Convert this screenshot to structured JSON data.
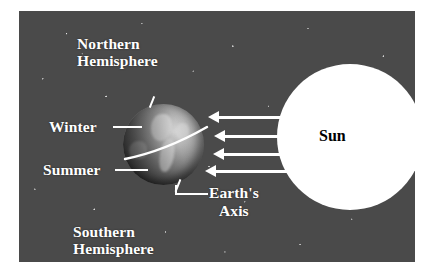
{
  "diagram": {
    "background_color": "#4a4a4a",
    "labels": {
      "northern_hemisphere": "Northern\nHemisphere",
      "southern_hemisphere": "Southern\nHemisphere",
      "winter": "Winter",
      "summer": "Summer",
      "earths_axis": "Earth's\nAxis",
      "sun": "Sun"
    },
    "objects": {
      "sun": {
        "name": "Sun",
        "shape": "circle",
        "fill_color": "#ffffff",
        "label_color": "#000000"
      },
      "earth": {
        "name": "Earth",
        "shape": "sphere",
        "equator_line_color": "#ffffff",
        "axis_color": "#ffffff",
        "axis_tilt_note": "tilted axis, North Pole leaning away from Sun"
      }
    },
    "sun_rays": {
      "count": 4,
      "color": "#ffffff",
      "direction": "right-to-left, from Sun toward Earth"
    },
    "leader_lines": {
      "color": "#ffffff",
      "count": 3
    }
  }
}
